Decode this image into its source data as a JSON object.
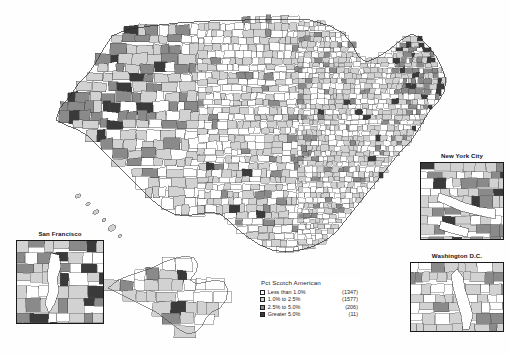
{
  "legend": {
    "title": "Pct Scotch American",
    "classes": [
      {
        "label": "Less than 1.0%",
        "count": "(1347)",
        "color": "#ffffff"
      },
      {
        "label": "1.0% to 2.5%",
        "count": "(1577)",
        "color": "#d2d2d2"
      },
      {
        "label": "2.5% to 5.0%",
        "count": "(206)",
        "color": "#8a8a8a"
      },
      {
        "label": "Greater 5.0%",
        "count": "(11)",
        "color": "#3a3a3a"
      }
    ]
  },
  "insets": [
    {
      "id": "san-francisco",
      "title": "San Francisco"
    },
    {
      "id": "new-york-city",
      "title": "New York City"
    },
    {
      "id": "washington-dc",
      "title": "Washington D.C."
    }
  ],
  "chart_data": {
    "type": "choropleth",
    "title": "Pct Scotch American",
    "unit": "percent of county population",
    "geography": "United States counties",
    "projection": "albers-usa",
    "classes": [
      {
        "range": "Less than 1.0%",
        "min": 0.0,
        "max": 1.0,
        "count": 1347,
        "color": "#ffffff"
      },
      {
        "range": "1.0% to 2.5%",
        "min": 1.0,
        "max": 2.5,
        "count": 1577,
        "color": "#d2d2d2"
      },
      {
        "range": "2.5% to 5.0%",
        "min": 2.5,
        "max": 5.0,
        "count": 206,
        "color": "#8a8a8a"
      },
      {
        "range": "Greater 5.0%",
        "min": 5.0,
        "max": null,
        "count": 11,
        "color": "#3a3a3a"
      }
    ],
    "total_counties": 3141,
    "legend_position": "bottom-center",
    "insets": [
      "San Francisco",
      "New York City",
      "Washington D.C."
    ],
    "regional_pattern": {
      "high": [
        "Pacific Northwest",
        "Northern Rockies",
        "Maine",
        "Vermont",
        "New Hampshire",
        "Western Mountain West"
      ],
      "low": [
        "Upper Midwest",
        "Great Plains",
        "Deep South",
        "Texas",
        "Appalachian Midwest"
      ]
    }
  }
}
